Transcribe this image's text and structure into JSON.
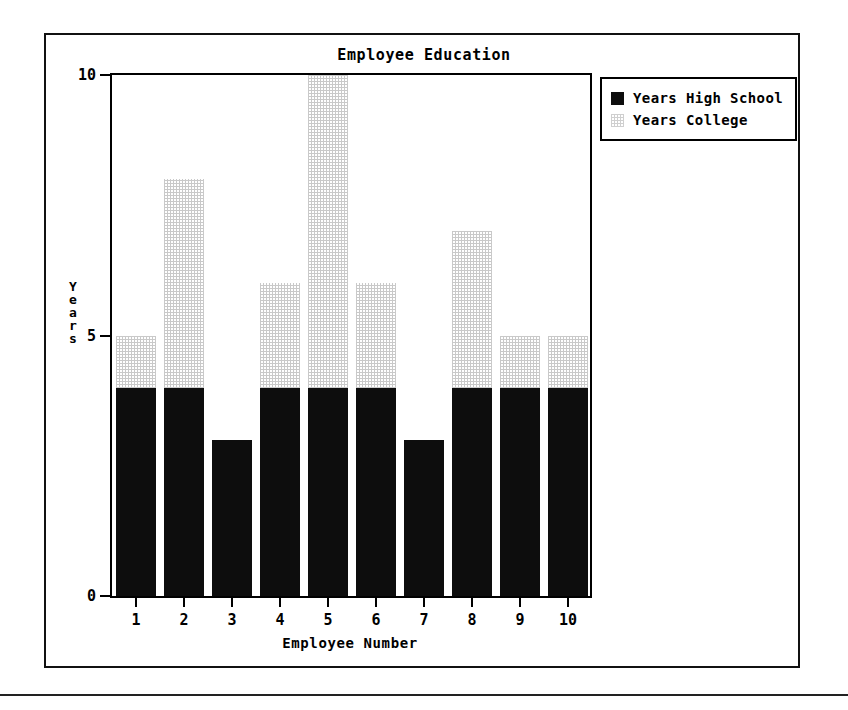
{
  "chart_data": {
    "type": "bar",
    "stacked": true,
    "title": "Employee Education",
    "xlabel": "Employee Number",
    "ylabel": "Years",
    "categories": [
      "1",
      "2",
      "3",
      "4",
      "5",
      "6",
      "7",
      "8",
      "9",
      "10"
    ],
    "series": [
      {
        "name": "Years High School",
        "color": "#0d0d0d",
        "values": [
          4,
          4,
          3,
          4,
          4,
          4,
          3,
          4,
          4,
          4
        ]
      },
      {
        "name": "Years College",
        "color": "#cfcfcf",
        "values": [
          1,
          4,
          0,
          2,
          6,
          2,
          0,
          3,
          1,
          1
        ]
      }
    ],
    "totals": [
      5,
      8,
      3,
      6,
      10,
      6,
      3,
      7,
      5,
      5
    ],
    "ylim": [
      0,
      10
    ],
    "y_ticks": [
      "0",
      "5",
      "10"
    ],
    "y_tick_values": [
      0,
      5,
      10
    ],
    "grid": false,
    "legend_position": "top-right"
  },
  "legend": {
    "entries": [
      {
        "label": "Years High School",
        "swatch": "solid-black-swatch"
      },
      {
        "label": "Years College",
        "swatch": "light-dotted-swatch"
      }
    ]
  },
  "axis": {
    "y_title_letters": [
      "Y",
      "e",
      "a",
      "r",
      "s"
    ]
  },
  "colors": {
    "ink": "#000000",
    "background": "#ffffff",
    "high_school_fill": "#0d0d0d",
    "college_fill": "#cfcfcf"
  }
}
